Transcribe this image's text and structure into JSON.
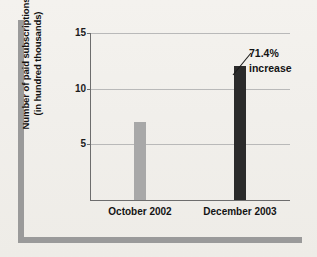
{
  "chart_data": {
    "type": "bar",
    "title": "",
    "subtitle": "",
    "xlabel": "",
    "ylabel_lines": [
      "Number of paid subscriptions",
      "(in hundred thousands)"
    ],
    "ylabel": "Number of paid subscriptions (in hundred thousands)",
    "categories": [
      "October 2002",
      "December 2003"
    ],
    "values": [
      7,
      12
    ],
    "series": [
      {
        "name": "Number of paid subscriptions",
        "values": [
          7,
          12
        ]
      }
    ],
    "bar_colors": [
      "#a8a8a8",
      "#2b2b2b"
    ],
    "ylim": [
      0,
      15
    ],
    "ytick_labels": [
      "5",
      "10",
      "15"
    ],
    "ytick_values": [
      5,
      10,
      15
    ],
    "grid": "horizontal",
    "legend": "none",
    "annotations": [
      {
        "text_lines": [
          "71.4%",
          "increase"
        ],
        "text": "71.4% increase",
        "points_to_category": "December 2003",
        "points_to_value": 12
      }
    ]
  },
  "figure": {
    "background_color": "#f2f0ec",
    "decoration_color": "#9a9a9a",
    "axis_color": "#6d6d6d",
    "gridline_color": "#b9b9b9",
    "text_color": "#141414"
  },
  "icons": {
    "leader_line": "leader-line-icon",
    "corner_rule": "corner-rule-icon"
  }
}
